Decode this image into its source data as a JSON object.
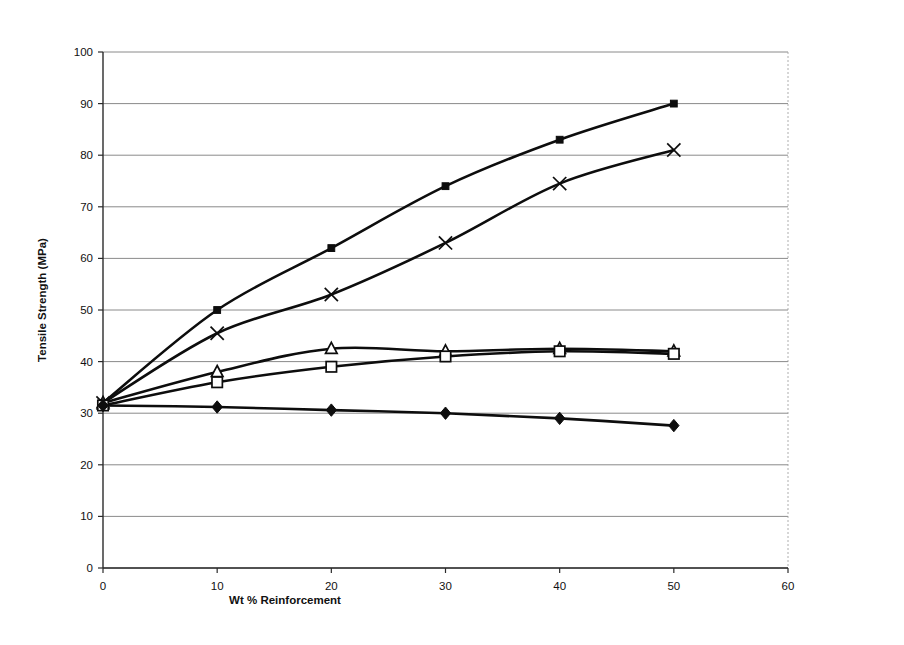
{
  "chart_data": {
    "type": "line",
    "title": "",
    "xlabel": "Wt % Reinforcement",
    "ylabel": "Tensile Strength (MPa)",
    "xlim": [
      0,
      60
    ],
    "ylim": [
      0,
      100
    ],
    "xticks": [
      0,
      10,
      20,
      30,
      40,
      50,
      60
    ],
    "yticks": [
      0,
      10,
      20,
      30,
      40,
      50,
      60,
      70,
      80,
      90,
      100
    ],
    "xtick_labels": [
      "0",
      "10",
      "20",
      "30",
      "40",
      "50",
      "60"
    ],
    "ytick_labels": [
      "0",
      "10",
      "20",
      "30",
      "40",
      "50",
      "60",
      "70",
      "80",
      "90",
      "100"
    ],
    "grid": "horizontal",
    "legend": "none",
    "x": [
      0,
      10,
      20,
      30,
      40,
      50
    ],
    "series": [
      {
        "name": "series-filled-square",
        "marker": "filled-square",
        "color": "#0d0d0d",
        "values": [
          32,
          50,
          62,
          74,
          83,
          90
        ]
      },
      {
        "name": "series-cross",
        "marker": "cross",
        "color": "#0d0d0d",
        "values": [
          32,
          45.5,
          53,
          63,
          74.5,
          81
        ]
      },
      {
        "name": "series-open-triangle",
        "marker": "open-triangle",
        "color": "#0d0d0d",
        "values": [
          32,
          38,
          42.5,
          42,
          42.5,
          42
        ]
      },
      {
        "name": "series-open-square",
        "marker": "open-square",
        "color": "#0d0d0d",
        "values": [
          31.5,
          36,
          39,
          41,
          42,
          41.5
        ]
      },
      {
        "name": "series-filled-diamond",
        "marker": "filled-diamond",
        "color": "#0d0d0d",
        "values": [
          31.5,
          31.2,
          30.6,
          30,
          29,
          27.6
        ]
      }
    ]
  },
  "axes": {
    "y_title": "Tensile Strength (MPa)",
    "x_title": "Wt % Reinforcement"
  }
}
